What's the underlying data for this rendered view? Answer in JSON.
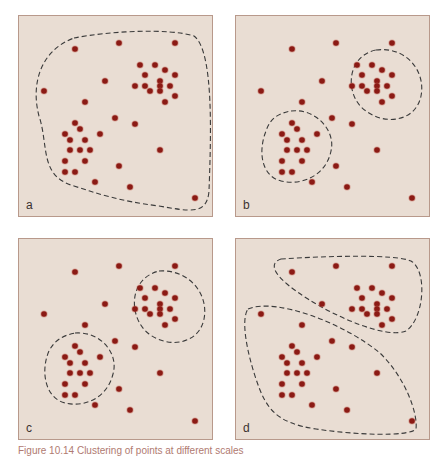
{
  "figure": {
    "caption": "Figure 10.14 Clustering of points at different scales",
    "colors": {
      "background": "#e9ddd3",
      "border": "#b8998b",
      "dot": "#8b1a14",
      "dot_halo": "#c0584a",
      "outline": "#3a3a3a"
    },
    "panels": [
      {
        "label": "a",
        "description": "single boundary enclosing all points"
      },
      {
        "label": "b",
        "description": "two tight clusters outlined"
      },
      {
        "label": "c",
        "description": "two clusters outlined with scattered points"
      },
      {
        "label": "d",
        "description": "two large regions partitioning the points"
      }
    ]
  }
}
